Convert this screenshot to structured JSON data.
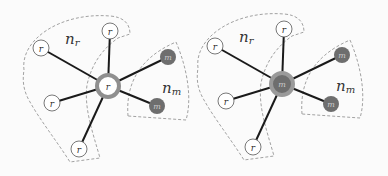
{
  "diagrams": [
    {
      "name": "left",
      "center": {
        "label": "r",
        "type": "r"
      },
      "region_labels": {
        "nr": {
          "base": "n",
          "sub": "r"
        },
        "nm": {
          "base": "n",
          "sub": "m"
        }
      },
      "neighbors": [
        {
          "label": "r",
          "type": "r"
        },
        {
          "label": "r",
          "type": "r"
        },
        {
          "label": "r",
          "type": "r"
        },
        {
          "label": "r",
          "type": "r"
        },
        {
          "label": "m",
          "type": "m"
        },
        {
          "label": "m",
          "type": "m"
        }
      ]
    },
    {
      "name": "right",
      "center": {
        "label": "m",
        "type": "m"
      },
      "region_labels": {
        "nr": {
          "base": "n",
          "sub": "r"
        },
        "nm": {
          "base": "n",
          "sub": "m"
        }
      },
      "neighbors": [
        {
          "label": "r",
          "type": "r"
        },
        {
          "label": "r",
          "type": "r"
        },
        {
          "label": "r",
          "type": "r"
        },
        {
          "label": "r",
          "type": "r"
        },
        {
          "label": "m",
          "type": "m"
        },
        {
          "label": "m",
          "type": "m"
        }
      ]
    }
  ],
  "colors": {
    "m_fill": "#6e6e6e",
    "center_ring": "#8f8f8f",
    "r_fill": "#ffffff",
    "edge": "#1a1a1a",
    "dash": "#888888"
  }
}
